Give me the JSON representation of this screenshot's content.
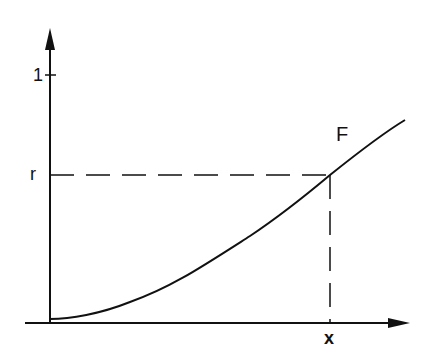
{
  "diagram": {
    "type": "cumulative distribution function plot",
    "curve_label": "F",
    "y_ticks": [
      {
        "label": "1",
        "value": 1
      },
      {
        "label": "r",
        "value": "r"
      }
    ],
    "x_ticks": [
      {
        "label": "x",
        "value": "x"
      }
    ],
    "colors": {
      "ink": "#111111",
      "background": "#ffffff"
    }
  }
}
